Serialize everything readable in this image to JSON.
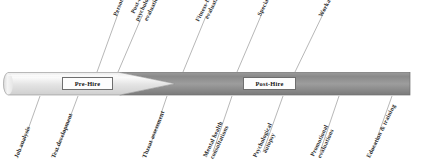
{
  "diagram": {
    "type": "arrow-timeline",
    "colors": {
      "bar_light_start": "#f2f2f2",
      "bar_light_end": "#d8d8d8",
      "bar_dark_start": "#7d7d7d",
      "bar_dark_end": "#a9a9a9",
      "bar_outline": "#6f6f6f",
      "leader_line": "#8a8a8a",
      "label_text": "#2b2b2b",
      "stage_box_bg": "#fdfdfd",
      "stage_box_border": "#6e6e6e"
    },
    "stages": [
      {
        "label": "Pre-Hire",
        "name": "pre-hire"
      },
      {
        "label": "Post-Hire",
        "name": "post-hire"
      }
    ],
    "callouts_above": [
      {
        "line1": "Personality screening",
        "line2": "",
        "name": "personality-screening"
      },
      {
        "line1": "Post-COS psychological",
        "line2": "evaluation",
        "name": "post-cos-psychological-evaluation"
      },
      {
        "line1": "Fitness-for-duty",
        "line2": "evaluations",
        "name": "fitness-for-duty-evaluations"
      },
      {
        "line1": "Specialty assignments",
        "line2": "",
        "name": "specialty-assignments"
      },
      {
        "line1": "Workability",
        "line2": "",
        "name": "workability"
      }
    ],
    "callouts_below": [
      {
        "line1": "Job analysis",
        "line2": "",
        "name": "job-analysis"
      },
      {
        "line1": "Test development",
        "line2": "",
        "name": "test-development"
      },
      {
        "line1": "Threat assessment",
        "line2": "",
        "name": "threat-assessment"
      },
      {
        "line1": "Mental health",
        "line2": "consultations",
        "name": "mental-health-consultations"
      },
      {
        "line1": "Psychological",
        "line2": "autopsy",
        "name": "psychological-autopsy"
      },
      {
        "line1": "Promotional",
        "line2": "evaluations",
        "name": "promotional-evaluations"
      },
      {
        "line1": "Education & training",
        "line2": "",
        "name": "education-and-training"
      }
    ]
  }
}
